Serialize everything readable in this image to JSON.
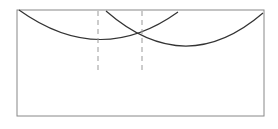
{
  "diagram": {
    "colors": {
      "frame": "#888888",
      "arc": "#333333",
      "dashed": "#999999",
      "background": "#ffffff"
    }
  }
}
